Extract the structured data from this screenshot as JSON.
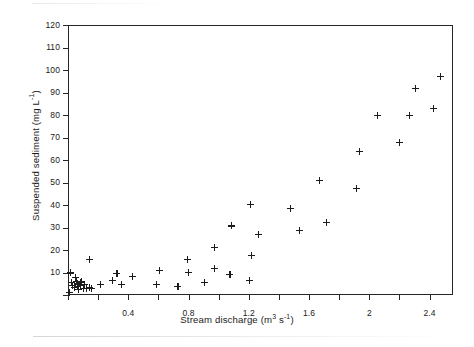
{
  "figure": {
    "background_color": "#ffffff",
    "axis_color": "#262626",
    "marker_color": "#1c1c1c",
    "marker_symbol": "plus"
  },
  "chart_data": {
    "type": "scatter",
    "title": "",
    "xlabel": "Stream discharge (m3 s-1)",
    "ylabel": "Suspended sediment (mg L-1)",
    "xlabel_parts": {
      "text": "Stream discharge (m",
      "sup1": "3",
      "mid": " s",
      "sup2": "-1",
      "close": ")"
    },
    "ylabel_parts": {
      "text": "Suspended sediment (mg  L",
      "sup1": "-1",
      "close": ")"
    },
    "xlim": [
      0,
      2.5556
    ],
    "ylim": [
      0,
      120
    ],
    "grid": false,
    "legend": null,
    "xticks": [
      0,
      0.2,
      0.4,
      0.6,
      0.8,
      1.0,
      1.2,
      1.4,
      1.6,
      1.8,
      2.0,
      2.2,
      2.4
    ],
    "xtick_labels": [
      "",
      "",
      "0.4",
      "",
      "0.8",
      "",
      "1.2",
      "",
      "1.6",
      "",
      "2",
      "",
      "2.4"
    ],
    "yticks": [
      0,
      10,
      20,
      30,
      40,
      50,
      60,
      70,
      80,
      90,
      100,
      110,
      120
    ],
    "ytick_labels": [
      "",
      "10",
      "20",
      "30",
      "40",
      "50",
      "60",
      "70",
      "80",
      "90",
      "100",
      "110",
      "120"
    ],
    "points": [
      {
        "x": 0.01,
        "y": 1.0
      },
      {
        "x": 0.015,
        "y": 9.8
      },
      {
        "x": 0.02,
        "y": 5.6
      },
      {
        "x": 0.03,
        "y": 4.4
      },
      {
        "x": 0.04,
        "y": 3.3
      },
      {
        "x": 0.05,
        "y": 7.6
      },
      {
        "x": 0.055,
        "y": 6.2
      },
      {
        "x": 0.06,
        "y": 4.9
      },
      {
        "x": 0.065,
        "y": 3.6
      },
      {
        "x": 0.07,
        "y": 2.6
      },
      {
        "x": 0.08,
        "y": 5.4
      },
      {
        "x": 0.085,
        "y": 4.2
      },
      {
        "x": 0.09,
        "y": 6.0
      },
      {
        "x": 0.1,
        "y": 3.1
      },
      {
        "x": 0.11,
        "y": 4.7
      },
      {
        "x": 0.125,
        "y": 3.0
      },
      {
        "x": 0.14,
        "y": 3.4
      },
      {
        "x": 0.155,
        "y": 2.9
      },
      {
        "x": 0.145,
        "y": 16.0
      },
      {
        "x": 0.215,
        "y": 4.6
      },
      {
        "x": 0.295,
        "y": 6.4
      },
      {
        "x": 0.325,
        "y": 9.4
      },
      {
        "x": 0.355,
        "y": 4.5
      },
      {
        "x": 0.425,
        "y": 8.1
      },
      {
        "x": 0.585,
        "y": 4.5
      },
      {
        "x": 0.605,
        "y": 10.8
      },
      {
        "x": 0.73,
        "y": 3.9
      },
      {
        "x": 0.795,
        "y": 16.0
      },
      {
        "x": 0.8,
        "y": 10.2
      },
      {
        "x": 0.905,
        "y": 5.4
      },
      {
        "x": 0.975,
        "y": 21.0
      },
      {
        "x": 0.975,
        "y": 11.9
      },
      {
        "x": 1.085,
        "y": 30.7
      },
      {
        "x": 1.075,
        "y": 9.0
      },
      {
        "x": 1.21,
        "y": 40.1
      },
      {
        "x": 1.215,
        "y": 17.4
      },
      {
        "x": 1.205,
        "y": 6.3
      },
      {
        "x": 1.265,
        "y": 26.9
      },
      {
        "x": 1.475,
        "y": 38.5
      },
      {
        "x": 1.535,
        "y": 28.6
      },
      {
        "x": 1.67,
        "y": 50.9
      },
      {
        "x": 1.715,
        "y": 32.4
      },
      {
        "x": 1.935,
        "y": 63.7
      },
      {
        "x": 1.915,
        "y": 47.2
      },
      {
        "x": 2.055,
        "y": 79.6
      },
      {
        "x": 2.2,
        "y": 67.7
      },
      {
        "x": 2.265,
        "y": 79.7
      },
      {
        "x": 2.305,
        "y": 91.7
      },
      {
        "x": 2.425,
        "y": 82.8
      },
      {
        "x": 2.475,
        "y": 97.0
      }
    ]
  }
}
